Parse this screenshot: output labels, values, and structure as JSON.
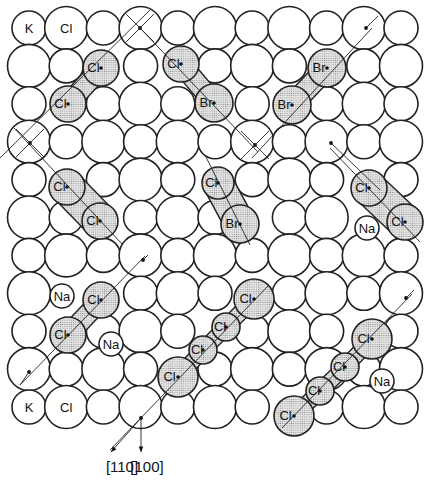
{
  "figure": {
    "width": 435,
    "height": 482
  },
  "lattice": {
    "cols": 11,
    "rows": 11,
    "origin_x": 29,
    "origin_y": 28,
    "pitch_x": 37.2,
    "pitch_y": 37.9,
    "small_radius": 17,
    "large_radius": 21.5,
    "corner_labels": [
      {
        "col": 0,
        "row": 0,
        "text": "K"
      },
      {
        "col": 1,
        "row": 0,
        "text": "Cl"
      },
      {
        "col": 0,
        "row": 10,
        "text": "K"
      },
      {
        "col": 1,
        "row": 10,
        "text": "Cl"
      }
    ]
  },
  "impurities": [
    {
      "text": "Na",
      "x": 367,
      "y": 228,
      "r": 12
    },
    {
      "text": "Na",
      "x": 62,
      "y": 296,
      "r": 12
    },
    {
      "text": "Na",
      "x": 111,
      "y": 344,
      "r": 12
    },
    {
      "text": "Na",
      "x": 382,
      "y": 381,
      "r": 12
    }
  ],
  "molecules": [
    {
      "name": "Cl2 [110]",
      "atoms": [
        {
          "text": "Cl",
          "x": 101,
          "y": 68,
          "r": 18
        },
        {
          "text": "Cl",
          "x": 68,
          "y": 104,
          "r": 18
        }
      ],
      "axis": [
        [
          0,
          158
        ],
        [
          150,
          10
        ]
      ]
    },
    {
      "name": "ClBr [1-10]",
      "atoms": [
        {
          "text": "Cl",
          "x": 181,
          "y": 64,
          "r": 18
        },
        {
          "text": "Br",
          "x": 214,
          "y": 103,
          "r": 19
        }
      ],
      "axis": [
        [
          140,
          28
        ],
        [
          258,
          152
        ]
      ]
    },
    {
      "name": "Br2 [110]",
      "atoms": [
        {
          "text": "Br",
          "x": 327,
          "y": 68,
          "r": 19
        },
        {
          "text": "Br",
          "x": 292,
          "y": 105,
          "r": 19
        }
      ],
      "axis": [
        [
          252,
          158
        ],
        [
          372,
          28
        ]
      ]
    },
    {
      "name": "Cl2 [1-10] pair",
      "atoms": [
        {
          "text": "Cl",
          "x": 67,
          "y": 187,
          "r": 18
        },
        {
          "text": "Cl",
          "x": 100,
          "y": 221,
          "r": 18
        }
      ],
      "axis": [
        [
          14,
          128
        ],
        [
          122,
          244
        ]
      ],
      "elongated": true
    },
    {
      "name": "ClBr [1-20]",
      "atoms": [
        {
          "text": "Cl",
          "x": 218,
          "y": 183,
          "r": 16
        },
        {
          "text": "Br",
          "x": 240,
          "y": 224,
          "r": 19
        }
      ],
      "axis": [
        [
          205,
          155
        ],
        [
          250,
          245
        ]
      ],
      "elongated": true
    },
    {
      "name": "Cl2 [1-10] right",
      "atoms": [
        {
          "text": "Cl",
          "x": 369,
          "y": 188,
          "r": 18
        },
        {
          "text": "Cl",
          "x": 405,
          "y": 222,
          "r": 18
        }
      ],
      "axis": [
        [
          330,
          148
        ],
        [
          420,
          242
        ]
      ],
      "elongated": true
    },
    {
      "name": "Cl2 [110] lower-left",
      "atoms": [
        {
          "text": "Cl",
          "x": 101,
          "y": 300,
          "r": 18
        },
        {
          "text": "Cl",
          "x": 68,
          "y": 335,
          "r": 18
        }
      ],
      "axis": [
        [
          20,
          385
        ],
        [
          145,
          256
        ]
      ]
    },
    {
      "name": "Cl4 chain centre",
      "atoms": [
        {
          "text": "Cl",
          "x": 254,
          "y": 299,
          "r": 20
        },
        {
          "text": "Cl",
          "x": 226,
          "y": 327,
          "r": 14
        },
        {
          "text": "Cl",
          "x": 203,
          "y": 350,
          "r": 14
        },
        {
          "text": "Cl",
          "x": 178,
          "y": 377,
          "r": 20
        }
      ],
      "axis": [
        [
          110,
          450
        ],
        [
          268,
          286
        ]
      ]
    },
    {
      "name": "Cl4 chain right",
      "atoms": [
        {
          "text": "Cl",
          "x": 372,
          "y": 339,
          "r": 20
        },
        {
          "text": "Cl",
          "x": 345,
          "y": 367,
          "r": 14
        },
        {
          "text": "Cl",
          "x": 320,
          "y": 391,
          "r": 14
        },
        {
          "text": "Cl",
          "x": 294,
          "y": 416,
          "r": 20
        }
      ],
      "axis": [
        [
          282,
          428
        ],
        [
          412,
          294
        ]
      ]
    }
  ],
  "marks": [
    {
      "type": "cross",
      "x": 140,
      "y": 28
    },
    {
      "type": "dot-line",
      "x": 366,
      "y": 28,
      "to": [
        378,
        16
      ]
    },
    {
      "type": "cross",
      "x": 30,
      "y": 143
    },
    {
      "type": "cross",
      "x": 255,
      "y": 145
    },
    {
      "type": "dot-line",
      "x": 331,
      "y": 143,
      "to": [
        380,
        190
      ]
    },
    {
      "type": "dot-line",
      "x": 143,
      "y": 260,
      "to": [
        148,
        255
      ]
    },
    {
      "type": "dot-line",
      "x": 406,
      "y": 298,
      "to": [
        414,
        290
      ]
    },
    {
      "type": "dot-line",
      "x": 29,
      "y": 372,
      "to": [
        20,
        385
      ]
    }
  ],
  "directions": {
    "origin": {
      "x": 141,
      "y": 418
    },
    "arrows": [
      {
        "label": "[110]",
        "to": [
          111,
          452
        ],
        "label_x": 122,
        "label_y": 472
      },
      {
        "label": "[100]",
        "to": [
          141,
          452
        ],
        "label_x": 147,
        "label_y": 472
      }
    ]
  }
}
